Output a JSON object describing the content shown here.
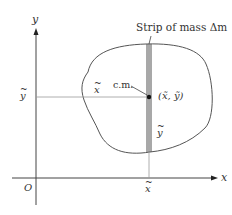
{
  "diagram": {
    "title": "",
    "axes": {
      "x_label": "x",
      "y_label": "y",
      "origin_label": "O"
    },
    "labels": {
      "strip": "Strip of mass Δm",
      "center_of_mass": "c.m.",
      "point": "(x̃, ỹ)",
      "x_tilde_inside": "x",
      "y_tilde_inside": "y",
      "y_tilde_axis": "y",
      "x_tilde_axis": "x"
    },
    "colors": {
      "line": "#555555",
      "strip": "#a8a8a8",
      "dot": "#111111",
      "guide": "#999999"
    }
  }
}
